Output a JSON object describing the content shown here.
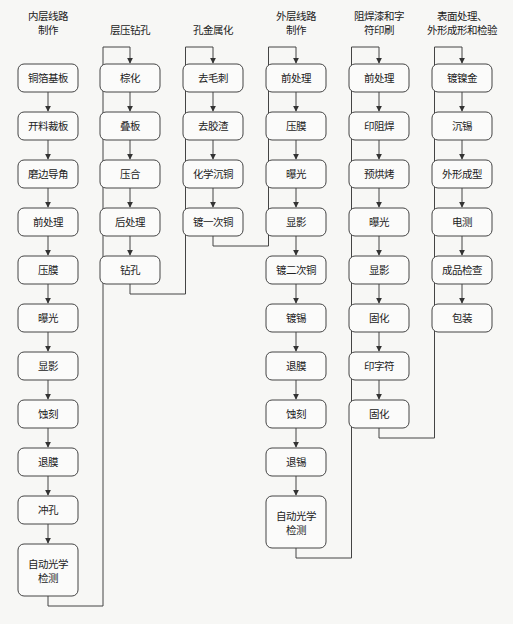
{
  "diagram": {
    "type": "flowchart",
    "caption": "",
    "columns": [
      {
        "title_lines": [
          "内层线路",
          "制作"
        ],
        "steps": [
          "铜箔基板",
          "开料裁板",
          "磨边导角",
          "前处理",
          "压膜",
          "曝光",
          "显影",
          "蚀刻",
          "退膜",
          "冲孔",
          "自动光学检测"
        ]
      },
      {
        "title_lines": [
          "层压钻孔"
        ],
        "steps": [
          "棕化",
          "叠板",
          "压合",
          "后处理",
          "钻孔"
        ]
      },
      {
        "title_lines": [
          "孔金属化"
        ],
        "steps": [
          "去毛刺",
          "去胶渣",
          "化学沉铜",
          "镀一次铜"
        ]
      },
      {
        "title_lines": [
          "外层线路",
          "制作"
        ],
        "steps": [
          "前处理",
          "压膜",
          "曝光",
          "显影",
          "镀二次铜",
          "镀锡",
          "退膜",
          "蚀刻",
          "退锡",
          "自动光学检测"
        ]
      },
      {
        "title_lines": [
          "阻焊漆和字",
          "符印刷"
        ],
        "steps": [
          "前处理",
          "印阻焊",
          "预烘烤",
          "曝光",
          "显影",
          "固化",
          "印字符",
          "固化"
        ]
      },
      {
        "title_lines": [
          "表面处理、",
          "外形成形和检验"
        ],
        "steps": [
          "镀镍金",
          "沉锡",
          "外形成型",
          "电测",
          "成品检查",
          "包装"
        ]
      }
    ],
    "colors": {
      "line": "#444444",
      "box_fill": "#fbfbfa",
      "background": "#f7f7f5"
    }
  }
}
